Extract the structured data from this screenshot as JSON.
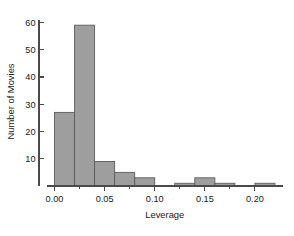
{
  "chart_data": {
    "type": "bar",
    "title": "",
    "subtitle": "",
    "xlabel": "Leverage",
    "ylabel": "Number of Movies",
    "bin_width": 0.02,
    "bin_starts": [
      0.0,
      0.02,
      0.04,
      0.06,
      0.08,
      0.1,
      0.12,
      0.14,
      0.16,
      0.18,
      0.2
    ],
    "bin_ends": [
      0.02,
      0.04,
      0.06,
      0.08,
      0.1,
      0.12,
      0.14,
      0.16,
      0.18,
      0.2,
      0.22
    ],
    "categories": [
      "0.00-0.02",
      "0.02-0.04",
      "0.04-0.06",
      "0.06-0.08",
      "0.08-0.10",
      "0.10-0.12",
      "0.12-0.14",
      "0.14-0.16",
      "0.16-0.18",
      "0.18-0.20",
      "0.20-0.22"
    ],
    "values": [
      27,
      59,
      9,
      5,
      3,
      0,
      1,
      3,
      1,
      0,
      1
    ],
    "xlim": [
      -0.008,
      0.228
    ],
    "ylim": [
      0,
      62
    ],
    "xticks": [
      0.0,
      0.05,
      0.1,
      0.15,
      0.2
    ],
    "xtick_labels": [
      "0.00",
      "0.05",
      "0.10",
      "0.15",
      "0.20"
    ],
    "xminor_ticks": [
      0.025,
      0.075,
      0.125,
      0.175
    ],
    "yticks": [
      10,
      20,
      30,
      40,
      50,
      60
    ],
    "ytick_labels": [
      "10",
      "20",
      "30",
      "40",
      "50",
      "60"
    ],
    "grid": false,
    "legend": null,
    "bar_fill_color": "#9e9e9e",
    "bar_edge_color": "#5c5c5c",
    "axis_color": "#4a4a4a",
    "background_color": "#ffffff"
  }
}
